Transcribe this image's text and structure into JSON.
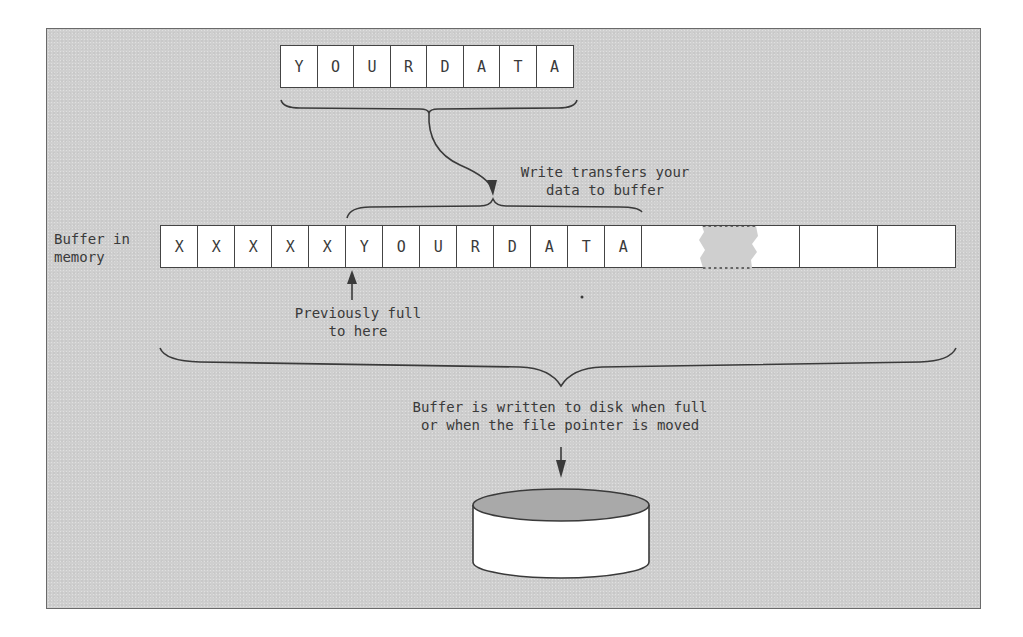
{
  "diagram": {
    "title": "",
    "source_block": {
      "cells": [
        "Y",
        "O",
        "U",
        "R",
        "D",
        "A",
        "T",
        "A"
      ]
    },
    "transfer_label": {
      "line1": "Write transfers your",
      "line2": "data to buffer"
    },
    "buffer": {
      "label_line1": "Buffer in",
      "label_line2": "memory",
      "filled_cells": [
        "X",
        "X",
        "X",
        "X",
        "X"
      ],
      "new_cells": [
        "Y",
        "O",
        "U",
        "R",
        "D",
        "A",
        "T",
        "A"
      ],
      "empty_cells_count": 4,
      "has_break_gap": true
    },
    "previous_marker": {
      "line1": "Previously full",
      "line2": "to here"
    },
    "flush_label": {
      "line1": "Buffer is written to disk when full",
      "line2": "or when the file pointer is moved"
    },
    "disk": {
      "label": "",
      "top_color": "#a9a9a9",
      "body_color": "#ffffff"
    },
    "colors": {
      "panel_background": "#cfcfcf",
      "stroke": "#444444",
      "text": "#3a3a3a"
    }
  }
}
